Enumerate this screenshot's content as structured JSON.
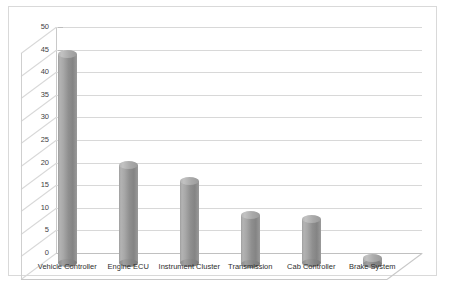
{
  "chart_data": {
    "type": "bar",
    "title": "",
    "subtitle": "",
    "xlabel": "",
    "ylabel": "",
    "categories": [
      "Vehicle Controller",
      "Engine ECU",
      "Instrument Cluster",
      "Transmission",
      "Cab Controller",
      "Brake System"
    ],
    "values": [
      48,
      23.5,
      20,
      12.5,
      11.5,
      3
    ],
    "ylim": [
      0,
      50
    ],
    "ytick_labels": [
      "0",
      "5",
      "10",
      "15",
      "20",
      "25",
      "30",
      "35",
      "40",
      "45",
      "50"
    ],
    "ytick_values": [
      0,
      5,
      10,
      15,
      20,
      25,
      30,
      35,
      40,
      45,
      50
    ],
    "grid": true,
    "legend": false,
    "legend_position": "none",
    "style": "3d-cylinder",
    "series": [
      {
        "name": "",
        "values": [
          48,
          23.5,
          20,
          12.5,
          11.5,
          3
        ]
      }
    ]
  },
  "colors": {
    "bar_light": "#b5b5b5",
    "bar_mid": "#9e9e9e",
    "bar_dark": "#848484",
    "gridline": "#d8d8d8",
    "axis": "#c0c0c0",
    "frame": "#d9d9d9",
    "text": "#2e2e2e",
    "background": "#ffffff"
  }
}
